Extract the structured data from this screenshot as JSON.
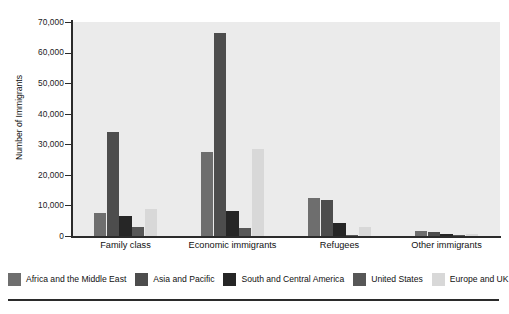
{
  "chart_data": {
    "type": "bar",
    "title": "",
    "xlabel": "",
    "ylabel": "Number of Immigrants",
    "ylim": [
      0,
      70000
    ],
    "ytick_labels": [
      "70,000",
      "60,000",
      "50,000",
      "40,000",
      "30,000",
      "20,000",
      "10,000",
      "0"
    ],
    "ytick_values": [
      70000,
      60000,
      50000,
      40000,
      30000,
      20000,
      10000,
      0
    ],
    "grid": false,
    "legend_position": "bottom",
    "categories": [
      "Family class",
      "Economic immigrants",
      "Refugees",
      "Other immigrants"
    ],
    "series": [
      {
        "name": "Africa and the Middle East",
        "color": "#6e6e6e",
        "values": [
          7500,
          27500,
          12300,
          1600
        ]
      },
      {
        "name": "Asia and Pacific",
        "color": "#4d4d4d",
        "values": [
          34000,
          66500,
          11700,
          1300
        ]
      },
      {
        "name": "South and Central America",
        "color": "#262626",
        "values": [
          6500,
          8300,
          4300,
          700
        ]
      },
      {
        "name": "United States",
        "color": "#575757",
        "values": [
          3000,
          2500,
          300,
          200
        ]
      },
      {
        "name": "Europe and UK",
        "color": "#d8d8d8",
        "values": [
          8800,
          28500,
          3000,
          600
        ]
      }
    ]
  },
  "colors": {
    "plot_background": "#ebebeb",
    "page_background": "#ffffff",
    "axis": "#2b2b2b",
    "text": "#111111"
  }
}
